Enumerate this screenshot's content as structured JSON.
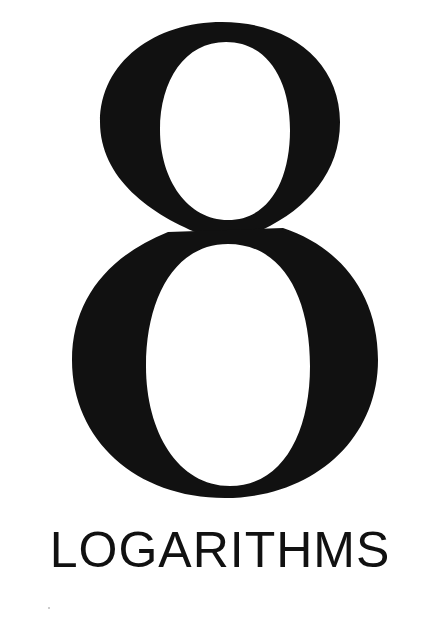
{
  "chapter": {
    "number": "8",
    "title": "LOGARITHMS"
  },
  "colors": {
    "ink": "#111111",
    "paper": "#ffffff"
  }
}
